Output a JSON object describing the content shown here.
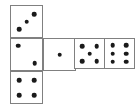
{
  "figure": {
    "kind": "dice-net",
    "description": "Unfolded cube net made of six square dice faces",
    "canvas": {
      "width": 138,
      "height": 107
    },
    "colors": {
      "background": "#ffffff",
      "face_fill": "#ffffff",
      "face_border": "#808080",
      "pip": "#1a1a1a"
    },
    "geometry": {
      "cell_size": 32,
      "pip_diameter": 4.6,
      "border_width": 1
    }
  },
  "faces": [
    {
      "id": "face-top-left",
      "name": "three",
      "value": 3,
      "arrangement": "anti-diagonal",
      "x": 10,
      "y": 5,
      "size": 33,
      "pips": [
        {
          "cx": 74,
          "cy": 26
        },
        {
          "cx": 50,
          "cy": 50
        },
        {
          "cx": 26,
          "cy": 74
        }
      ]
    },
    {
      "id": "face-mid-left",
      "name": "two",
      "value": 2,
      "arrangement": "main-diagonal",
      "x": 10,
      "y": 38,
      "size": 33,
      "pips": [
        {
          "cx": 24,
          "cy": 22
        },
        {
          "cx": 76,
          "cy": 78
        }
      ]
    },
    {
      "id": "face-bottom-left",
      "name": "four",
      "value": 4,
      "arrangement": "four-corners",
      "x": 10,
      "y": 71,
      "size": 33,
      "pips": [
        {
          "cx": 26,
          "cy": 26
        },
        {
          "cx": 74,
          "cy": 26
        },
        {
          "cx": 26,
          "cy": 74
        },
        {
          "cx": 74,
          "cy": 74
        }
      ]
    },
    {
      "id": "face-mid-second",
      "name": "one",
      "value": 1,
      "arrangement": "center",
      "x": 43,
      "y": 38,
      "size": 33,
      "pips": [
        {
          "cx": 50,
          "cy": 50
        }
      ]
    },
    {
      "id": "face-mid-third",
      "name": "five",
      "value": 5,
      "arrangement": "four-corners-plus-center",
      "x": 74,
      "y": 38,
      "size": 31,
      "pips": [
        {
          "cx": 25,
          "cy": 24
        },
        {
          "cx": 75,
          "cy": 24
        },
        {
          "cx": 50,
          "cy": 50
        },
        {
          "cx": 25,
          "cy": 76
        },
        {
          "cx": 75,
          "cy": 76
        }
      ]
    },
    {
      "id": "face-mid-fourth",
      "name": "six",
      "value": 6,
      "arrangement": "two-columns-of-three",
      "x": 104,
      "y": 38,
      "size": 31,
      "pips": [
        {
          "cx": 26,
          "cy": 22
        },
        {
          "cx": 74,
          "cy": 22
        },
        {
          "cx": 26,
          "cy": 50
        },
        {
          "cx": 74,
          "cy": 50
        },
        {
          "cx": 26,
          "cy": 78
        },
        {
          "cx": 74,
          "cy": 78
        }
      ]
    }
  ]
}
